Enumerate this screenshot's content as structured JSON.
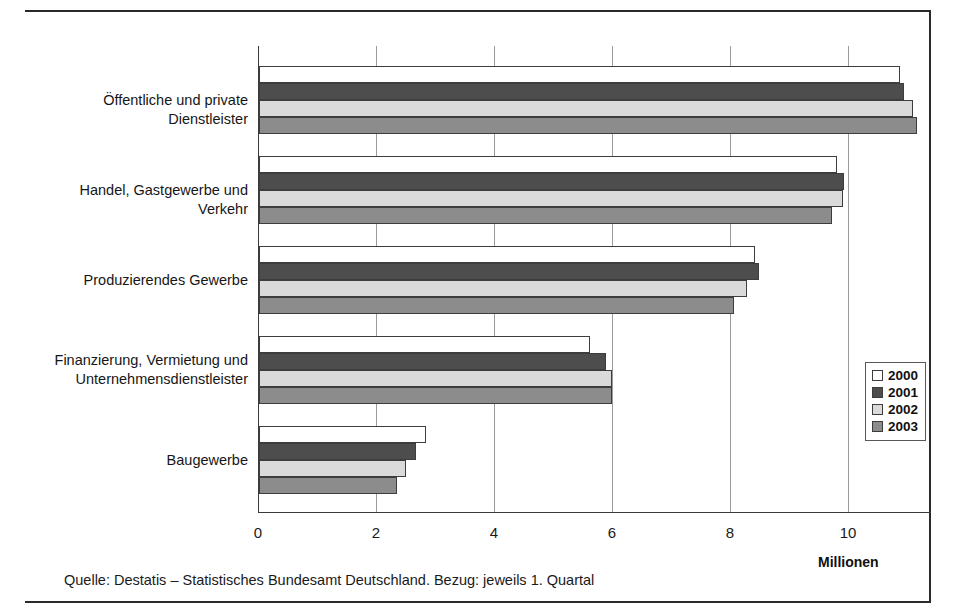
{
  "figure": {
    "unit_label": "Millionen",
    "caption": "Quelle: Destatis – Statistisches Bundesamt Deutschland. Bezug: jeweils 1. Quartal"
  },
  "legend": {
    "items": [
      {
        "label": "2000",
        "color": "#ffffff"
      },
      {
        "label": "2001",
        "color": "#4d4d4d"
      },
      {
        "label": "2002",
        "color": "#dadada"
      },
      {
        "label": "2003",
        "color": "#8c8c8c"
      }
    ]
  },
  "chart_data": {
    "type": "bar",
    "orientation": "horizontal",
    "title": "",
    "xlabel": "Millionen",
    "ylabel": "",
    "xlim": [
      0,
      11.4
    ],
    "xticks": [
      "0",
      "2",
      "4",
      "6",
      "8",
      "10"
    ],
    "xtick_values": [
      0,
      2,
      4,
      6,
      8,
      10
    ],
    "grid": true,
    "grid_axis": "x",
    "legend_position": "bottom-right",
    "categories": [
      "Öffentliche und private Dienstleister",
      "Handel, Gastgewerbe und Verkehr",
      "Produzierendes Gewerbe",
      "Finanzierung, Vermietung und\nUnternehmensdienstleister",
      "Baugewerbe"
    ],
    "series": [
      {
        "name": "2000",
        "values": [
          10.86,
          9.79,
          8.4,
          5.61,
          2.83
        ]
      },
      {
        "name": "2001",
        "values": [
          10.93,
          9.91,
          8.47,
          5.88,
          2.66
        ]
      },
      {
        "name": "2002",
        "values": [
          11.09,
          9.89,
          8.27,
          5.98,
          2.49
        ]
      },
      {
        "name": "2003",
        "values": [
          11.15,
          9.71,
          8.05,
          5.98,
          2.34
        ]
      }
    ]
  }
}
